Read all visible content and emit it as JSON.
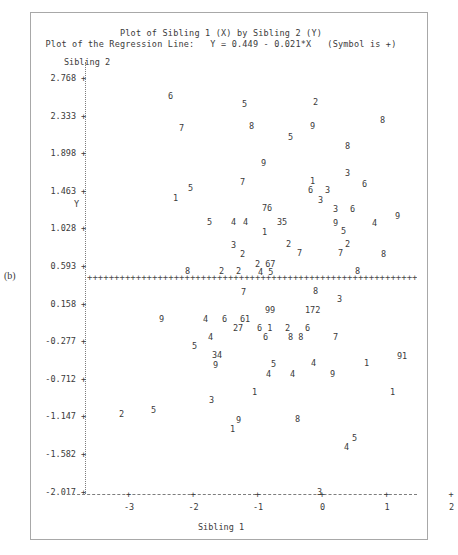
{
  "figure": {
    "panel_letter": "(b)",
    "title_line1": "Plot of Sibling 1 (X) by Sibling 2 (Y)",
    "title_line2": "Plot of the Regression Line:   Y = 0.449 - 0.021*X   (Symbol is +)",
    "y_axis_title": "Sibling 2",
    "y_axis_letter": "Y",
    "x_axis_title": "Sibling 1",
    "regression_glyphs": "+++++++++++++++++++++++++++++++++++++++++++++++++++++++++++++++++++++++++++++++++++++++++++++++++++++++++++++++"
  },
  "chart_data": {
    "type": "scatter",
    "title": "Plot of Sibling 1 (X) by Sibling 2 (Y)",
    "subtitle": "Plot of the Regression Line:   Y = 0.449 - 0.021*X   (Symbol is +)",
    "xlabel": "Sibling 1",
    "ylabel": "Sibling 2",
    "y_axis_letter": "Y",
    "xlim": [
      -3.35,
      2.3
    ],
    "ylim": [
      -2.017,
      2.985
    ],
    "grid": false,
    "legend": "none",
    "point_symbol": "digit-label",
    "regression": {
      "equation": "Y = 0.449 - 0.021*X",
      "intercept": 0.449,
      "slope": -0.021,
      "symbol": "+"
    },
    "y_ticks": [
      2.768,
      2.333,
      1.898,
      1.463,
      1.028,
      0.593,
      0.158,
      -0.277,
      -0.712,
      -1.147,
      -1.582,
      -2.017
    ],
    "y_tick_labels": [
      "2.768",
      "2.333",
      "1.898",
      "1.463",
      "1.028",
      "0.593",
      "0.158",
      "-0.277",
      "-0.712",
      "-1.147",
      "-1.582",
      "-2.017"
    ],
    "x_ticks": [
      -3,
      -2,
      -1,
      0,
      1,
      2
    ],
    "x_tick_labels": [
      "-3",
      "-2",
      "-1",
      "0",
      "1",
      "2"
    ],
    "points": [
      {
        "label": "6",
        "px": 168,
        "py": 92
      },
      {
        "label": "5",
        "px": 242,
        "py": 100
      },
      {
        "label": "2",
        "px": 313,
        "py": 98
      },
      {
        "label": "7",
        "px": 179,
        "py": 124
      },
      {
        "label": "8",
        "px": 249,
        "py": 122
      },
      {
        "label": "9",
        "px": 310,
        "py": 122
      },
      {
        "label": "8",
        "px": 380,
        "py": 116
      },
      {
        "label": "5",
        "px": 288,
        "py": 133
      },
      {
        "label": "8",
        "px": 345,
        "py": 142
      },
      {
        "label": "9",
        "px": 261,
        "py": 159
      },
      {
        "label": "3",
        "px": 345,
        "py": 169
      },
      {
        "label": "7",
        "px": 240,
        "py": 178
      },
      {
        "label": "1",
        "px": 310,
        "py": 177
      },
      {
        "label": "6",
        "px": 362,
        "py": 180
      },
      {
        "label": "5",
        "px": 188,
        "py": 184
      },
      {
        "label": "6",
        "px": 308,
        "py": 186
      },
      {
        "label": "3",
        "px": 325,
        "py": 186
      },
      {
        "label": "1",
        "px": 173,
        "py": 194
      },
      {
        "label": "3",
        "px": 318,
        "py": 196
      },
      {
        "label": "76",
        "px": 262,
        "py": 204
      },
      {
        "label": "3",
        "px": 333,
        "py": 205
      },
      {
        "label": "6",
        "px": 350,
        "py": 205
      },
      {
        "label": "5",
        "px": 207,
        "py": 218
      },
      {
        "label": "4",
        "px": 231,
        "py": 218
      },
      {
        "label": "4",
        "px": 243,
        "py": 218
      },
      {
        "label": "35",
        "px": 277,
        "py": 218
      },
      {
        "label": "9",
        "px": 333,
        "py": 219
      },
      {
        "label": "4",
        "px": 372,
        "py": 219
      },
      {
        "label": "9",
        "px": 395,
        "py": 212
      },
      {
        "label": "1",
        "px": 262,
        "py": 228
      },
      {
        "label": "5",
        "px": 341,
        "py": 227
      },
      {
        "label": "3",
        "px": 231,
        "py": 241
      },
      {
        "label": "2",
        "px": 286,
        "py": 240
      },
      {
        "label": "2",
        "px": 345,
        "py": 240
      },
      {
        "label": "2",
        "px": 240,
        "py": 250
      },
      {
        "label": "7",
        "px": 297,
        "py": 249
      },
      {
        "label": "7",
        "px": 338,
        "py": 249
      },
      {
        "label": "8",
        "px": 381,
        "py": 250
      },
      {
        "label": "2 67",
        "px": 255,
        "py": 260
      },
      {
        "label": "8",
        "px": 185,
        "py": 267
      },
      {
        "label": "2",
        "px": 219,
        "py": 267
      },
      {
        "label": "2",
        "px": 236,
        "py": 267
      },
      {
        "label": "4 5",
        "px": 258,
        "py": 268
      },
      {
        "label": "8",
        "px": 355,
        "py": 267
      },
      {
        "label": "7",
        "px": 241,
        "py": 288
      },
      {
        "label": "8",
        "px": 313,
        "py": 287
      },
      {
        "label": "3",
        "px": 337,
        "py": 295
      },
      {
        "label": "99",
        "px": 265,
        "py": 306
      },
      {
        "label": "172",
        "px": 305,
        "py": 306
      },
      {
        "label": "9",
        "px": 159,
        "py": 315
      },
      {
        "label": "4",
        "px": 203,
        "py": 315
      },
      {
        "label": "6",
        "px": 222,
        "py": 315
      },
      {
        "label": "61",
        "px": 240,
        "py": 315
      },
      {
        "label": "27",
        "px": 233,
        "py": 324
      },
      {
        "label": "6 1",
        "px": 257,
        "py": 324
      },
      {
        "label": "2",
        "px": 285,
        "py": 324
      },
      {
        "label": "6",
        "px": 305,
        "py": 324
      },
      {
        "label": "4",
        "px": 208,
        "py": 333
      },
      {
        "label": "6",
        "px": 263,
        "py": 333
      },
      {
        "label": "8 8",
        "px": 288,
        "py": 333
      },
      {
        "label": "7",
        "px": 333,
        "py": 333
      },
      {
        "label": "5",
        "px": 192,
        "py": 342
      },
      {
        "label": "34",
        "px": 212,
        "py": 351
      },
      {
        "label": "91",
        "px": 397,
        "py": 352
      },
      {
        "label": "9",
        "px": 213,
        "py": 361
      },
      {
        "label": "5",
        "px": 271,
        "py": 360
      },
      {
        "label": "4",
        "px": 311,
        "py": 359
      },
      {
        "label": "1",
        "px": 364,
        "py": 359
      },
      {
        "label": "4",
        "px": 266,
        "py": 370
      },
      {
        "label": "4",
        "px": 290,
        "py": 370
      },
      {
        "label": "9",
        "px": 330,
        "py": 370
      },
      {
        "label": "1",
        "px": 252,
        "py": 388
      },
      {
        "label": "1",
        "px": 390,
        "py": 388
      },
      {
        "label": "3",
        "px": 209,
        "py": 396
      },
      {
        "label": "2",
        "px": 119,
        "py": 410
      },
      {
        "label": "5",
        "px": 151,
        "py": 406
      },
      {
        "label": "9",
        "px": 236,
        "py": 416
      },
      {
        "label": "8",
        "px": 295,
        "py": 415
      },
      {
        "label": "1",
        "px": 230,
        "py": 425
      },
      {
        "label": "5",
        "px": 352,
        "py": 434
      },
      {
        "label": "4",
        "px": 344,
        "py": 443
      },
      {
        "label": "3",
        "px": 317,
        "py": 488
      }
    ]
  }
}
